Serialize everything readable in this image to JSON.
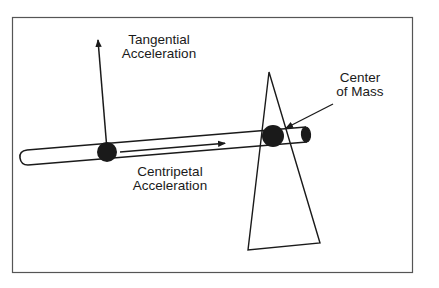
{
  "diagram": {
    "type": "physics-illustration",
    "labels": {
      "tangential": {
        "line1": "Tangential",
        "line2": "Acceleration"
      },
      "centripetal": {
        "line1": "Centripetal",
        "line2": "Acceleration"
      },
      "center_of_mass": {
        "line1": "Center",
        "line2": "of Mass"
      }
    },
    "elements": [
      "frame",
      "rod",
      "outer-mass",
      "center-mass",
      "cone-pivot",
      "tangential-acceleration-arrow",
      "centripetal-acceleration-arrow",
      "center-of-mass-pointer"
    ],
    "colors": {
      "stroke": "#1a1a1a",
      "frame": "#555555",
      "fill_mass": "#1a1a1a",
      "background": "#ffffff"
    }
  }
}
